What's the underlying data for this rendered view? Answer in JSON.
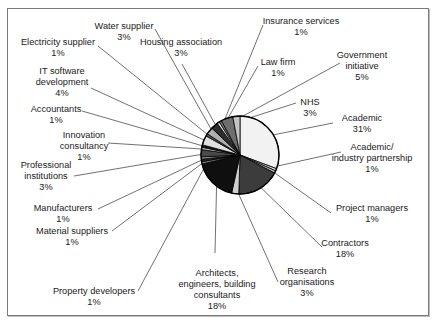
{
  "chart_data": {
    "type": "pie",
    "title": "",
    "start_angle_deg": 0,
    "direction": "clockwise",
    "slices": [
      {
        "label": "Academic",
        "value": 31,
        "display": "31%",
        "color": "#f2f2f2",
        "lx": 362,
        "ly": 113,
        "ax": 333,
        "ay": 123
      },
      {
        "label": "Academic/ industry partnership",
        "value": 1,
        "display": "1%",
        "color": "#d8d8d8",
        "lx": 372,
        "ly": 142,
        "ax": 341,
        "ay": 152
      },
      {
        "label": "Project managers",
        "value": 1,
        "display": "1%",
        "color": "#bfbfbf",
        "lx": 364,
        "ly": 203,
        "ax": 331,
        "ay": 213
      },
      {
        "label": "Contractors",
        "value": 18,
        "display": "18%",
        "color": "#3c3c3c",
        "lx": 345,
        "ly": 238,
        "ax": 322,
        "ay": 247
      },
      {
        "label": "Research organisations",
        "value": 3,
        "display": "3%",
        "color": "#cfcfcf",
        "lx": 307,
        "ly": 266,
        "ax": 278,
        "ay": 282
      },
      {
        "label": "Architects, engineers, building consultants",
        "value": 18,
        "display": "18%",
        "color": "#0f0f0f",
        "lx": 217,
        "ly": 268,
        "ax": 215,
        "ay": 253
      },
      {
        "label": "Property developers",
        "value": 1,
        "display": "1%",
        "color": "#808080",
        "lx": 97,
        "ly": 286,
        "ax": 138,
        "ay": 291
      },
      {
        "label": "Material suppliers",
        "value": 1,
        "display": "1%",
        "color": "#2a2a2a",
        "lx": 72,
        "ly": 226,
        "ax": 112,
        "ay": 231
      },
      {
        "label": "Manufacturers",
        "value": 1,
        "display": "1%",
        "color": "#9a9a9a",
        "lx": 61,
        "ly": 203,
        "ax": 98,
        "ay": 209
      },
      {
        "label": "Professional institutions",
        "value": 3,
        "display": "3%",
        "color": "#4a4a4a",
        "lx": 46,
        "ly": 166,
        "ax": 74,
        "ay": 176
      },
      {
        "label": "Innovation consultancy",
        "value": 1,
        "display": "1%",
        "color": "#d0d0d0",
        "lx": 84,
        "ly": 130,
        "ax": 108,
        "ay": 143
      },
      {
        "label": "Accountants",
        "value": 1,
        "display": "1%",
        "color": "#1e1e1e",
        "lx": 56,
        "ly": 104,
        "ax": 82,
        "ay": 111
      },
      {
        "label": "IT software development",
        "value": 4,
        "display": "4%",
        "color": "#e0e0e0",
        "lx": 64,
        "ly": 65,
        "ax": 91,
        "ay": 88
      },
      {
        "label": "Electricity supplier",
        "value": 1,
        "display": "1%",
        "color": "#5a5a5a",
        "lx": 58,
        "ly": 37,
        "ax": 98,
        "ay": 46
      },
      {
        "label": "Water supplier",
        "value": 3,
        "display": "3%",
        "color": "#b0b0b0",
        "lx": 126,
        "ly": 21,
        "ax": 155,
        "ay": 29
      },
      {
        "label": "Housing association",
        "value": 3,
        "display": "3%",
        "color": "#2e2e2e",
        "lx": 181,
        "ly": 37,
        "ax": 182,
        "ay": 64
      },
      {
        "label": "Insurance services",
        "value": 1,
        "display": "1%",
        "color": "#e8e8e8",
        "lx": 301,
        "ly": 16,
        "ax": 263,
        "ay": 25
      },
      {
        "label": "Law firm",
        "value": 1,
        "display": "1%",
        "color": "#7a7a7a",
        "lx": 278,
        "ly": 57,
        "ax": 258,
        "ay": 66
      },
      {
        "label": "Government initiative",
        "value": 5,
        "display": "5%",
        "color": "#6e6e6e",
        "lx": 358,
        "ly": 50,
        "ax": 340,
        "ay": 63
      },
      {
        "label": "NHS",
        "value": 3,
        "display": "3%",
        "color": "#c4c4c4",
        "lx": 310,
        "ly": 97,
        "ax": 296,
        "ay": 103
      }
    ],
    "legend": "none (callout labels)"
  },
  "labels": {
    "academic": [
      "Academic",
      "31%"
    ],
    "academic_industry": [
      "Academic/",
      "industry partnership",
      "1%"
    ],
    "project_managers": [
      "Project managers",
      "1%"
    ],
    "contractors": [
      "Contractors",
      "18%"
    ],
    "research": [
      "Research",
      "organisations",
      "3%"
    ],
    "architects": [
      "Architects,",
      "engineers, building",
      "consultants",
      "18%"
    ],
    "property": [
      "Property developers",
      "1%"
    ],
    "material": [
      "Material suppliers",
      "1%"
    ],
    "manufacturers": [
      "Manufacturers",
      "1%"
    ],
    "professional": [
      "Professional",
      "institutions",
      "3%"
    ],
    "innovation": [
      "Innovation",
      "consultancy",
      "1%"
    ],
    "accountants": [
      "Accountants",
      "1%"
    ],
    "it_software": [
      "IT software",
      "development",
      "4%"
    ],
    "electricity": [
      "Electricity supplier",
      "1%"
    ],
    "water": [
      "Water supplier",
      "3%"
    ],
    "housing": [
      "Housing association",
      "3%"
    ],
    "insurance": [
      "Insurance services",
      "1%"
    ],
    "law": [
      "Law firm",
      "1%"
    ],
    "government": [
      "Government",
      "initiative",
      "5%"
    ],
    "nhs": [
      "NHS",
      "3%"
    ]
  }
}
